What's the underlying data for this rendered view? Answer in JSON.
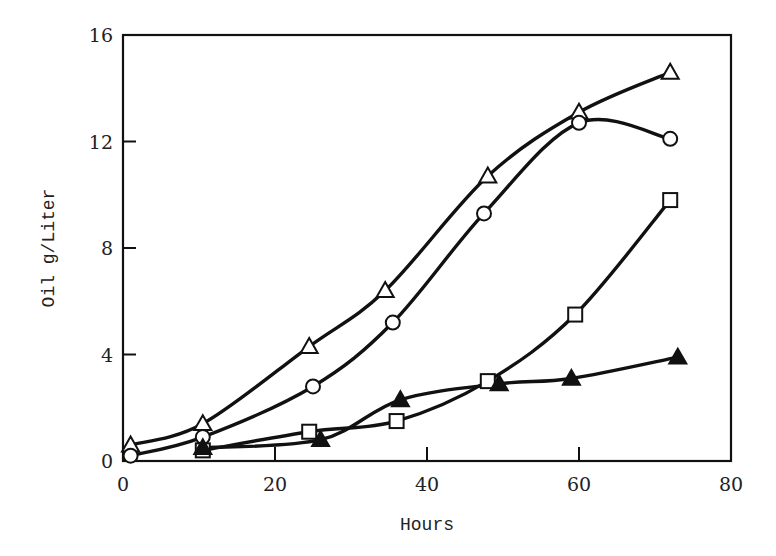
{
  "chart_data": {
    "type": "line",
    "title": "",
    "xlabel": "Hours",
    "ylabel": "Oil g/Liter",
    "xlim": [
      0,
      80
    ],
    "ylim": [
      0,
      16
    ],
    "xticks": [
      0,
      20,
      40,
      60,
      80
    ],
    "yticks": [
      0,
      4,
      8,
      12,
      16
    ],
    "grid": false,
    "legend": "none",
    "series": [
      {
        "name": "open-triangle",
        "marker": "triangle-open",
        "x": [
          1,
          10.5,
          24.5,
          34.5,
          48,
          60,
          72
        ],
        "y": [
          0.6,
          1.4,
          4.3,
          6.4,
          10.7,
          13.1,
          14.6
        ]
      },
      {
        "name": "open-circle",
        "marker": "circle-open",
        "x": [
          1,
          10.5,
          25,
          35.5,
          47.5,
          60,
          72
        ],
        "y": [
          0.2,
          0.9,
          2.8,
          5.2,
          9.3,
          12.7,
          12.1
        ]
      },
      {
        "name": "open-square",
        "marker": "square-open",
        "x": [
          10.5,
          24.5,
          36,
          48,
          59.5,
          72
        ],
        "y": [
          0.4,
          1.1,
          1.5,
          3.0,
          5.5,
          9.8
        ]
      },
      {
        "name": "filled-triangle",
        "marker": "triangle-filled",
        "x": [
          10.5,
          26,
          36.5,
          49.5,
          59,
          73
        ],
        "y": [
          0.5,
          0.8,
          2.3,
          2.9,
          3.1,
          3.9
        ]
      }
    ]
  },
  "axes": {
    "x_title": "Hours",
    "y_title": "Oil g/Liter",
    "x_tick_labels": [
      "0",
      "20",
      "40",
      "60",
      "80"
    ],
    "y_tick_labels": [
      "0",
      "4",
      "8",
      "12",
      "16"
    ]
  },
  "colors": {
    "ink": "#111111",
    "background": "#ffffff"
  }
}
